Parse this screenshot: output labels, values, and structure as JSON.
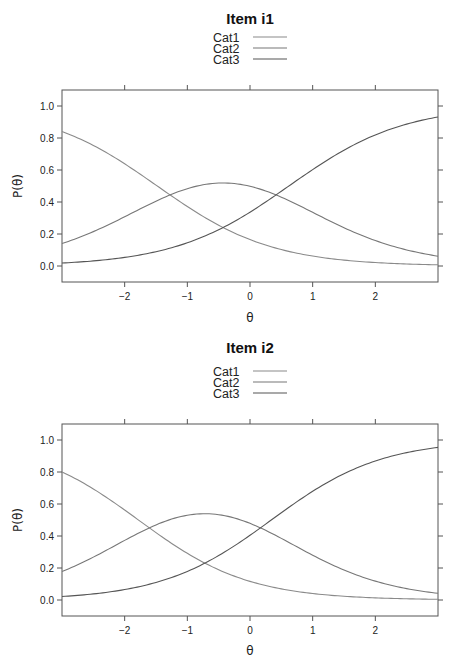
{
  "chart_data": [
    {
      "type": "line",
      "title": "Item i1",
      "xlabel": "θ",
      "ylabel": "P(θ)",
      "xlim": [
        -3,
        3
      ],
      "ylim": [
        -0.1,
        1.1
      ],
      "xticks": [
        -2,
        -1,
        0,
        1,
        2
      ],
      "xtick_labels": [
        "−2",
        "−1",
        "0",
        "1",
        "2"
      ],
      "yticks": [
        0.0,
        0.2,
        0.4,
        0.6,
        0.8,
        1.0
      ],
      "ytick_labels": [
        "0.0",
        "0.2",
        "0.4",
        "0.6",
        "0.8",
        "1.0"
      ],
      "grid": false,
      "legend_position": "top-center",
      "model": {
        "a": 1.095,
        "b": [
          -1.48,
          0.62
        ]
      },
      "x": [
        -3,
        -2.5,
        -2,
        -1.5,
        -1,
        -0.5,
        -0.43,
        0,
        0.5,
        1,
        1.5,
        2,
        2.5,
        3
      ],
      "series": [
        {
          "name": "Cat1",
          "color": "#8a8a8a",
          "values": [
            0.84,
            0.76,
            0.64,
            0.49,
            0.37,
            0.25,
            0.24,
            0.17,
            0.1,
            0.06,
            0.04,
            0.02,
            0.01,
            0.01
          ]
        },
        {
          "name": "Cat2",
          "color": "#777777",
          "values": [
            0.15,
            0.22,
            0.32,
            0.43,
            0.5,
            0.52,
            0.525,
            0.49,
            0.43,
            0.34,
            0.25,
            0.17,
            0.11,
            0.07
          ]
        },
        {
          "name": "Cat3",
          "color": "#555555",
          "values": [
            0.01,
            0.02,
            0.04,
            0.07,
            0.13,
            0.23,
            0.24,
            0.34,
            0.47,
            0.6,
            0.71,
            0.81,
            0.88,
            0.93
          ]
        }
      ]
    },
    {
      "type": "line",
      "title": "Item i2",
      "xlabel": "θ",
      "ylabel": "P(θ)",
      "xlim": [
        -3,
        3
      ],
      "ylim": [
        -0.1,
        1.1
      ],
      "xticks": [
        -2,
        -1,
        0,
        1,
        2
      ],
      "xtick_labels": [
        "−2",
        "−1",
        "0",
        "1",
        "2"
      ],
      "yticks": [
        0.0,
        0.2,
        0.4,
        0.6,
        0.8,
        1.0
      ],
      "ytick_labels": [
        "0.0",
        "0.2",
        "0.4",
        "0.6",
        "0.8",
        "1.0"
      ],
      "grid": false,
      "legend_position": "top-center",
      "model": {
        "a": 1.138,
        "b": [
          -1.78,
          0.34
        ]
      },
      "x": [
        -3,
        -2.5,
        -2,
        -1.5,
        -1,
        -0.72,
        -0.5,
        0,
        0.5,
        1,
        1.5,
        2,
        2.5,
        3
      ],
      "series": [
        {
          "name": "Cat1",
          "color": "#8a8a8a",
          "values": [
            0.8,
            0.69,
            0.56,
            0.42,
            0.29,
            0.23,
            0.19,
            0.12,
            0.07,
            0.04,
            0.02,
            0.01,
            0.01,
            0.0
          ]
        },
        {
          "name": "Cat2",
          "color": "#777777",
          "values": [
            0.19,
            0.28,
            0.39,
            0.48,
            0.52,
            0.525,
            0.52,
            0.46,
            0.37,
            0.28,
            0.19,
            0.12,
            0.08,
            0.05
          ]
        },
        {
          "name": "Cat3",
          "color": "#555555",
          "values": [
            0.01,
            0.02,
            0.04,
            0.09,
            0.17,
            0.23,
            0.29,
            0.42,
            0.56,
            0.68,
            0.79,
            0.86,
            0.91,
            0.95
          ]
        }
      ]
    }
  ]
}
